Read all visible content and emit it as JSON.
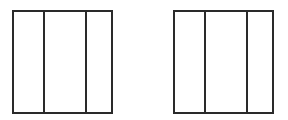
{
  "diagram": {
    "stroke_color": "#2a2a2a",
    "background": "#ffffff",
    "figures": [
      {
        "name": "left-rectangle",
        "x": 12,
        "y": 10,
        "width": 101,
        "height": 104,
        "dividers_x": [
          29,
          71
        ],
        "sections": 3
      },
      {
        "name": "right-rectangle",
        "x": 173,
        "y": 10,
        "width": 101,
        "height": 104,
        "dividers_x": [
          29,
          71
        ],
        "sections": 3
      }
    ]
  }
}
